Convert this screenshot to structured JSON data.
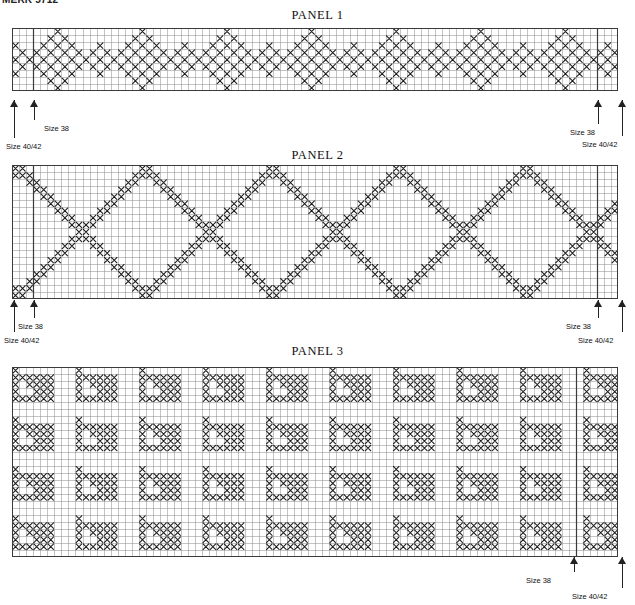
{
  "document": {
    "header_fragment": "MERK 5712"
  },
  "panels": [
    {
      "id": "panel-1",
      "title": "PANEL 1",
      "grid": {
        "cols": 86,
        "rows": 9,
        "cell": 7.05
      },
      "geometry": {
        "x": 12,
        "y": 28,
        "title_y": 8
      },
      "pattern": "star-diamond-band",
      "motif": {
        "repeat_cols": 12,
        "description": "eight-point star / diamond motif repeated horizontally across a 9-row band"
      },
      "annotations": [
        {
          "name": "size-38-left",
          "label": "Size 38",
          "col": 3,
          "side": "left",
          "label_x": 44,
          "label_y": 124,
          "arrow_x": 34,
          "stem_top": 100,
          "stem_bottom": 120
        },
        {
          "name": "size-4042-left",
          "label": "Size 40/42",
          "col": 0,
          "side": "left",
          "label_x": 6,
          "label_y": 142,
          "arrow_x": 14,
          "stem_top": 100,
          "stem_bottom": 138
        },
        {
          "name": "size-38-right",
          "label": "Size 38",
          "col": 83,
          "side": "right",
          "label_x": 570,
          "label_y": 128,
          "arrow_x": 598,
          "stem_top": 100,
          "stem_bottom": 124
        },
        {
          "name": "size-4042-right",
          "label": "Size 40/42",
          "col": 86,
          "side": "right",
          "label_x": 582,
          "label_y": 140,
          "arrow_x": 622,
          "stem_top": 100,
          "stem_bottom": 136
        }
      ]
    },
    {
      "id": "panel-2",
      "title": "PANEL 2",
      "grid": {
        "cols": 86,
        "rows": 19,
        "cell": 7.05
      },
      "geometry": {
        "x": 12,
        "y": 165,
        "title_y": 148
      },
      "pattern": "large-diamond-lattice",
      "motif": {
        "repeat_cols": 18,
        "description": "large open diamond lattice formed by double diagonal lines of crosses"
      },
      "annotations": [
        {
          "name": "size-38-left",
          "label": "Size 38",
          "col": 3,
          "side": "left",
          "label_x": 18,
          "label_y": 322,
          "arrow_x": 34,
          "stem_top": 300,
          "stem_bottom": 318
        },
        {
          "name": "size-4042-left",
          "label": "Size 40/42",
          "col": 0,
          "side": "left",
          "label_x": 4,
          "label_y": 336,
          "arrow_x": 14,
          "stem_top": 300,
          "stem_bottom": 332
        },
        {
          "name": "size-38-right",
          "label": "Size 38",
          "col": 83,
          "side": "right",
          "label_x": 566,
          "label_y": 322,
          "arrow_x": 598,
          "stem_top": 300,
          "stem_bottom": 318
        },
        {
          "name": "size-4042-right",
          "label": "Size 40/42",
          "col": 86,
          "side": "right",
          "label_x": 578,
          "label_y": 336,
          "arrow_x": 622,
          "stem_top": 300,
          "stem_bottom": 332
        }
      ]
    },
    {
      "id": "panel-3",
      "title": "PANEL 3",
      "grid": {
        "cols": 86,
        "rows": 27,
        "cell": 7.05
      },
      "geometry": {
        "x": 12,
        "y": 367,
        "title_y": 344
      },
      "pattern": "corner-triangle-allover",
      "motif": {
        "repeat_cols": 9,
        "repeat_rows": 7,
        "description": "all-over repeat of small filled corner / triangle motifs separated by plain grid channels"
      },
      "annotations": [
        {
          "name": "size-38-right",
          "label": "Size 38",
          "col": 80,
          "side": "right",
          "label_x": 526,
          "label_y": 576,
          "arrow_x": 574,
          "stem_top": 557,
          "stem_bottom": 572
        },
        {
          "name": "size-4042-right",
          "label": "Size 40/42",
          "col": 86,
          "side": "right",
          "label_x": 572,
          "label_y": 592,
          "arrow_x": 622,
          "stem_top": 557,
          "stem_bottom": 588
        }
      ]
    }
  ],
  "colors": {
    "grid_line": "#8a8a8a",
    "grid_line_major": "#3a3a3a",
    "stitch": "#1a1a1a",
    "background": "#ffffff",
    "text": "#111111"
  },
  "legend": {
    "symbol": "X",
    "meaning": "cross stitch"
  }
}
